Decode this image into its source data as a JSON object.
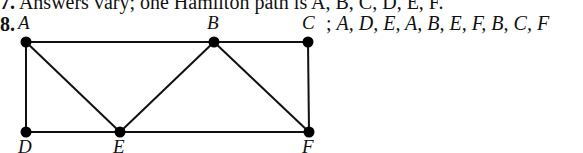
{
  "prev_answer": {
    "number": "7.",
    "text": "Answers vary; one Hamilton path is A, B, C, D, E, F."
  },
  "problem": {
    "number": "8.",
    "answer_separator": ";",
    "answer_path": "A, D, E, A, B, E, F, B, C, F"
  },
  "graph": {
    "vertices": [
      {
        "id": "A",
        "label": "A",
        "x": 26,
        "y": 42
      },
      {
        "id": "B",
        "label": "B",
        "x": 214,
        "y": 42
      },
      {
        "id": "C",
        "label": "C",
        "x": 308,
        "y": 42
      },
      {
        "id": "D",
        "label": "D",
        "x": 26,
        "y": 132
      },
      {
        "id": "E",
        "label": "E",
        "x": 120,
        "y": 132
      },
      {
        "id": "F",
        "label": "F",
        "x": 309,
        "y": 132
      }
    ],
    "edges": [
      [
        "A",
        "B"
      ],
      [
        "B",
        "C"
      ],
      [
        "A",
        "D"
      ],
      [
        "A",
        "E"
      ],
      [
        "D",
        "E"
      ],
      [
        "E",
        "B"
      ],
      [
        "B",
        "F"
      ],
      [
        "C",
        "F"
      ],
      [
        "E",
        "F"
      ]
    ],
    "edge_color": "#111111",
    "vertex_color": "#000000"
  }
}
